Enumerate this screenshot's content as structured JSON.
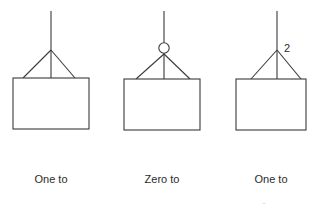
{
  "figure": {
    "background_color": "#ffffff",
    "line_color": "#3a3a3a",
    "text_color": "#2b2b2b",
    "stroke_width": 1.1
  },
  "notations": [
    {
      "id": "one-to-many",
      "label_line1": "One to",
      "label_line2": "many",
      "connector": {
        "stem_x": 51,
        "stem_top_y": 11,
        "vertex_y": 50,
        "entity_top_y": 78,
        "foot_left_x": 23,
        "foot_right_x": 75
      },
      "optionality_circle": null,
      "cardinality_annotation": null,
      "entity_box": {
        "x": 13,
        "y": 78,
        "width": 76,
        "height": 51
      },
      "label_box": {
        "x": 13,
        "y": 158,
        "width": 76
      }
    },
    {
      "id": "zero-to-many",
      "label_line1": "Zero to",
      "label_line2": "many",
      "connector": {
        "stem_x": 164,
        "stem_top_y": 11,
        "vertex_y": 54,
        "entity_top_y": 79,
        "foot_left_x": 136,
        "foot_right_x": 190
      },
      "optionality_circle": {
        "cx": 164,
        "cy": 48,
        "r": 5.2
      },
      "cardinality_annotation": null,
      "entity_box": {
        "x": 124,
        "y": 79,
        "width": 76,
        "height": 51
      },
      "label_box": {
        "x": 124,
        "y": 158,
        "width": 76
      }
    },
    {
      "id": "one-to-two",
      "label_line1": "One to",
      "label_line2": "<two>",
      "connector": {
        "stem_x": 277,
        "stem_top_y": 11,
        "vertex_y": 50,
        "entity_top_y": 79,
        "foot_left_x": 251,
        "foot_right_x": 301
      },
      "optionality_circle": null,
      "cardinality_annotation": {
        "text": "2",
        "x": 284,
        "y": 52
      },
      "entity_box": {
        "x": 236,
        "y": 79,
        "width": 70,
        "height": 51
      },
      "label_box": {
        "x": 232,
        "y": 158,
        "width": 78
      }
    }
  ]
}
